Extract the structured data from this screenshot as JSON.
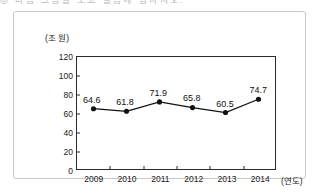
{
  "clipped_header": {
    "text": "◎ 다음 그림을 보고 물음에 답하시오."
  },
  "chart_data": {
    "type": "line",
    "title": "",
    "subtitle": "",
    "xlabel": "(연도)",
    "ylabel": "(조 원)",
    "categories": [
      "2009",
      "2010",
      "2011",
      "2012",
      "2013",
      "2014"
    ],
    "values": [
      64.6,
      61.8,
      71.9,
      65.8,
      60.5,
      74.7
    ],
    "point_labels": [
      "64.6",
      "61.8",
      "71.9",
      "65.8",
      "60.5",
      "74.7"
    ],
    "ylim": [
      0,
      120
    ],
    "y_ticks": [
      0,
      20,
      40,
      60,
      80,
      100,
      120
    ],
    "y_tick_labels": [
      "0",
      "20",
      "40",
      "60",
      "80",
      "100",
      "120"
    ],
    "grid": false,
    "legend": false,
    "marker": "filled-circle",
    "line_color": "#111111",
    "marker_color": "#111111",
    "axis_color": "#2b2b2b",
    "frame_color": "#c8c8c8",
    "background": "#ffffff"
  }
}
